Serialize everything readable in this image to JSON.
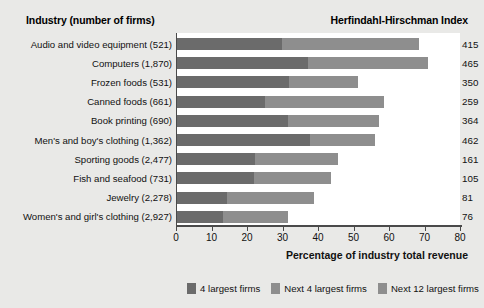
{
  "headers": {
    "industry": "Industry (number of firms)",
    "hhi": "Herfindahl-Hirschman Index"
  },
  "axis": {
    "title": "Percentage of industry total revenue",
    "ticks": [
      "0",
      "10",
      "20",
      "30",
      "40",
      "50",
      "60",
      "70",
      "80"
    ]
  },
  "legend": [
    {
      "label": "4 largest firms",
      "color": "#6b6b6b"
    },
    {
      "label": "Next 4 largest firms",
      "color": "#8e8e8e"
    },
    {
      "label": "Next 12 largest firms",
      "color": "#8e8e8e"
    }
  ],
  "chart_data": {
    "type": "bar",
    "orientation": "horizontal",
    "stacked": true,
    "title": "",
    "xlabel": "Percentage of industry total revenue",
    "ylabel": "Industry (number of firms)",
    "xlim": [
      0,
      80
    ],
    "grid": false,
    "legend_position": "bottom",
    "categories": [
      "Audio and video equipment  (521)",
      "Computers  (1,870)",
      "Frozen foods  (531)",
      "Canned foods  (661)",
      "Book printing  (690)",
      "Men's and boy's clothing  (1,362)",
      "Sporting goods  (2,477)",
      "Fish and seafood  (731)",
      "Jewelry  (2,278)",
      "Women's and girl's clothing  (2,927)"
    ],
    "series": [
      {
        "name": "4 largest firms",
        "values": [
          29.6,
          36.9,
          31.5,
          24.8,
          31.3,
          37.5,
          22.0,
          21.7,
          14.1,
          13.0
        ]
      },
      {
        "name": "Next 4 largest firms",
        "values": [
          38.6,
          33.8,
          19.5,
          33.5,
          25.6,
          18.3,
          23.4,
          21.7,
          24.5,
          18.3
        ]
      },
      {
        "name": "Next 12 largest firms",
        "values": [
          0,
          0,
          0,
          0,
          0,
          0,
          0,
          0,
          0,
          0
        ]
      }
    ],
    "hhi_values": [
      415,
      465,
      350,
      259,
      364,
      462,
      161,
      105,
      81,
      76
    ],
    "hhi_label": "Herfindahl-Hirschman Index"
  }
}
